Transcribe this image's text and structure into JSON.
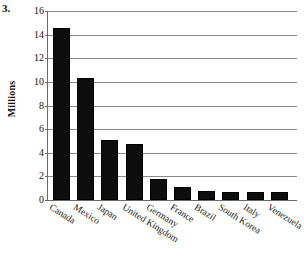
{
  "figure": {
    "item_number": "3.",
    "y_axis_title": "Millions"
  },
  "chart_data": {
    "type": "bar",
    "title": "",
    "xlabel": "",
    "ylabel": "Millions",
    "ylim": [
      0,
      16
    ],
    "ytick_step": 2,
    "yticks": [
      "0",
      "2",
      "4",
      "6",
      "8",
      "10",
      "12",
      "14",
      "16"
    ],
    "grid": true,
    "legend": "none",
    "bar_color": "#0d0d0d",
    "categories": [
      "Canada",
      "Mexico",
      "Japan",
      "United Kingdom",
      "Germany",
      "France",
      "Brazil",
      "South Korea",
      "Italy",
      "Venezuela"
    ],
    "values": [
      14.6,
      10.3,
      5.05,
      4.75,
      1.75,
      1.1,
      0.8,
      0.65,
      0.65,
      0.65
    ]
  }
}
